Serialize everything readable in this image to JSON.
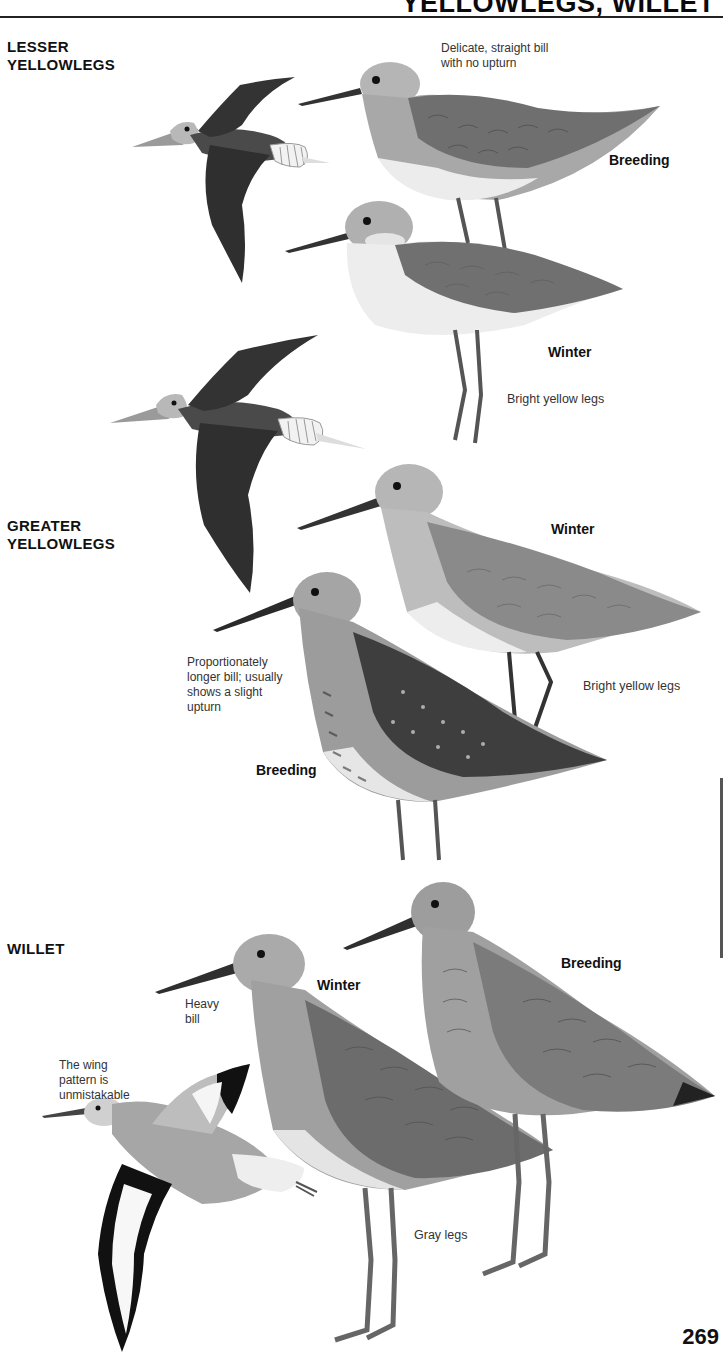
{
  "header": {
    "title": "YELLOWLEGS, WILLET"
  },
  "species": [
    {
      "name_lines": [
        "LESSER",
        "YELLOWLEGS"
      ],
      "plumage_labels": [
        "Breeding",
        "Winter"
      ],
      "notes": [
        "Delicate, straight bill with no upturn",
        "Bright yellow legs"
      ]
    },
    {
      "name_lines": [
        "GREATER",
        "YELLOWLEGS"
      ],
      "plumage_labels": [
        "Winter",
        "Breeding"
      ],
      "notes": [
        "Proportionately longer bill; usually shows a slight upturn",
        "Bright yellow legs"
      ]
    },
    {
      "name_lines": [
        "WILLET"
      ],
      "plumage_labels": [
        "Winter",
        "Breeding"
      ],
      "notes": [
        "Heavy bill",
        "The wing pattern is unmistakable",
        "Gray legs"
      ]
    }
  ],
  "note_lines": {
    "lesser_bill": [
      "Delicate, straight bill",
      "with no upturn"
    ],
    "greater_bill": [
      "Proportionately",
      "longer bill; usually",
      "shows a slight",
      "upturn"
    ],
    "willet_bill": [
      "Heavy",
      "bill"
    ],
    "willet_wing": [
      "The wing",
      "pattern is",
      "unmistakable"
    ]
  },
  "illustrations": [
    "lesser-yellowlegs-flight",
    "lesser-yellowlegs-breeding",
    "lesser-yellowlegs-winter",
    "greater-yellowlegs-flight",
    "greater-yellowlegs-winter",
    "greater-yellowlegs-breeding",
    "willet-flight",
    "willet-winter",
    "willet-breeding"
  ],
  "page_number": "269"
}
